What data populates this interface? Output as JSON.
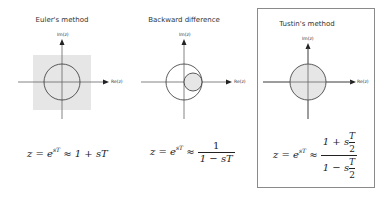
{
  "panels": [
    {
      "id": "euler",
      "title": "Euler's method",
      "axis_x_label": "Re(z)",
      "axis_y_label": "Im(z)",
      "stable_region": "shaded half-plane square (gray) with unit circle",
      "equation": {
        "lhs": "z = e",
        "exp": "sT",
        "approx": "≈",
        "rhs": "1 + sT"
      }
    },
    {
      "id": "backward",
      "title": "Backward difference",
      "axis_x_label": "Re(z)",
      "axis_y_label": "Im(z)",
      "stable_region": "small shaded circle inside unit circle",
      "equation": {
        "lhs": "z = e",
        "exp": "sT",
        "approx": "≈",
        "num": "1",
        "den": "1 − sT"
      }
    },
    {
      "id": "tustin",
      "title": "Tustin's method",
      "axis_x_label": "Re(z)",
      "axis_y_label": "Im(z)",
      "stable_region": "entire unit circle shaded",
      "highlighted": true,
      "equation": {
        "lhs": "z = e",
        "exp": "sT",
        "approx": "≈",
        "num_prefix": "1 + s",
        "den_prefix": "1 − s",
        "half_num": "T",
        "half_den": "2"
      }
    }
  ],
  "colors": {
    "shade": "#e6e6e6",
    "line": "#333333",
    "axis": "#666666",
    "frame": "#8a8a8a"
  }
}
